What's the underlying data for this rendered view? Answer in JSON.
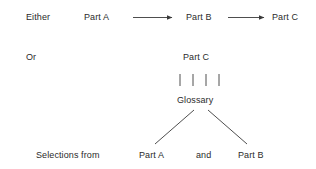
{
  "diagram": {
    "background_color": "#ffffff",
    "text_color": "#2b2b2b",
    "line_color": "#3a3a3a",
    "rows": {
      "either_label": "Either",
      "or_label": "Or",
      "selections_label": "Selections from"
    },
    "sequence_row": {
      "part_a": "Part A",
      "part_b": "Part B",
      "part_c": "Part C"
    },
    "glossary_branch": {
      "part_c": "Part C",
      "glossary": "Glossary",
      "tick_count": 4
    },
    "selection_row": {
      "part_a": "Part A",
      "conjunction": "and",
      "part_b": "Part B"
    },
    "connectors": {
      "arrow_1": "arrow-right",
      "arrow_2": "arrow-right",
      "ticks": "vertical-tick-group",
      "branch_left": "diagonal-line",
      "branch_right": "diagonal-line"
    }
  }
}
